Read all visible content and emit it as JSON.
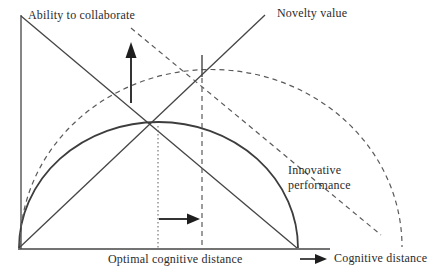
{
  "figure": {
    "kind": "conceptual-diagram",
    "topic": "optimal cognitive distance",
    "background_color": "#ffffff",
    "line_color": "#454545",
    "text_color": "#2b2b2b",
    "labels": {
      "ability_to_collaborate": "Ability to collaborate",
      "novelty_value": "Novelty value",
      "innovative_performance": "Innovative\nperformance",
      "optimal_cognitive_distance": "Optimal cognitive distance",
      "cognitive_distance": "Cognitive distance"
    },
    "curves": [
      {
        "name": "ability-to-collaborate-line",
        "style": "solid",
        "shape": "straight declining from top of y-axis to x-axis"
      },
      {
        "name": "novelty-value-line",
        "style": "solid",
        "shape": "straight rising from origin to top right"
      },
      {
        "name": "innovative-performance-curve",
        "style": "solid",
        "shape": "inverted-U peaking at optimal cognitive distance"
      },
      {
        "name": "shifted-ability-line",
        "style": "dashed",
        "shape": "straight declining, shifted right of solid line"
      },
      {
        "name": "shifted-performance-curve",
        "style": "dashed",
        "shape": "inverted-U shifted right and up"
      }
    ],
    "annotations": [
      {
        "name": "optimal-distance-marker",
        "style": "dotted vertical line at solid-curve peak"
      },
      {
        "name": "shifted-optimum-marker",
        "style": "dashed vertical line at dashed-curve peak"
      },
      {
        "name": "shifted-optimum-tick",
        "style": "short solid vertical tick at dashed-curve peak"
      },
      {
        "name": "upward-shift-arrow",
        "style": "solid arrow pointing up"
      },
      {
        "name": "rightward-shift-arrow",
        "style": "solid arrow pointing right"
      },
      {
        "name": "x-axis-direction-arrow",
        "style": "solid arrow pointing right before axis label"
      }
    ]
  }
}
